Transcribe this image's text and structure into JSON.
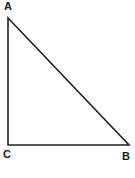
{
  "figure": {
    "name": "right-triangle-ABC",
    "canvas": {
      "width": 135,
      "height": 178
    },
    "background_color": "#ffffff",
    "stroke_color": "#222222",
    "stroke_width": 1.6,
    "label_color": "#1a1a1a"
  },
  "labels": {
    "a": "A",
    "b": "B",
    "c": "C"
  },
  "chart_data": {
    "type": "diagram",
    "shape": "right-triangle",
    "title": "",
    "vertices": [
      {
        "name": "A",
        "x": 8,
        "y": 18,
        "label": "A",
        "label_x": 4,
        "label_y": 1
      },
      {
        "name": "C",
        "x": 8,
        "y": 145,
        "label": "C",
        "label_x": 3,
        "label_y": 149
      },
      {
        "name": "B",
        "x": 129,
        "y": 145,
        "label": "B",
        "label_x": 122,
        "label_y": 151
      }
    ],
    "edges": [
      {
        "name": "AC",
        "from": "A",
        "to": "C",
        "role": "vertical-leg"
      },
      {
        "name": "CB",
        "from": "C",
        "to": "B",
        "role": "horizontal-leg"
      },
      {
        "name": "AB",
        "from": "A",
        "to": "B",
        "role": "hypotenuse"
      }
    ],
    "right_angle_at": "C",
    "xlabel": "",
    "ylabel": ""
  }
}
